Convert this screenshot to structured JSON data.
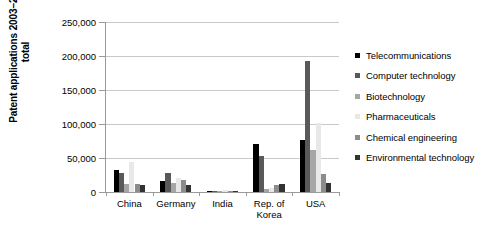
{
  "chart_data": {
    "type": "bar",
    "title": "",
    "subtitle": "",
    "xlabel": "",
    "ylabel": "Patent applications 2003–2007 total",
    "ylabel_lines": [
      "Patent applications 2003–2007",
      "total"
    ],
    "ylim": [
      0,
      250000
    ],
    "ytick_values": [
      0,
      50000,
      100000,
      150000,
      200000,
      250000
    ],
    "ytick_labels": [
      "0",
      "50,000",
      "100,000",
      "150,000",
      "200,000",
      "250,000"
    ],
    "grid": true,
    "grid_axis": "y",
    "legend_position": "right",
    "categories": [
      "China",
      "Germany",
      "India",
      "Rep. of Korea",
      "USA"
    ],
    "category_labels": [
      "China",
      "Germany",
      "India",
      "Rep. of\nKorea",
      "USA"
    ],
    "series": [
      {
        "name": "Telecommunications",
        "color": "#000000",
        "values": [
          32000,
          15500,
          1200,
          71000,
          77000
        ]
      },
      {
        "name": "Computer technology",
        "color": "#595959",
        "values": [
          28500,
          28000,
          1800,
          53000,
          192000
        ]
      },
      {
        "name": "Biotechnology",
        "color": "#a6a6a6",
        "values": [
          12500,
          13000,
          1500,
          5000,
          62000
        ]
      },
      {
        "name": "Pharmaceuticals",
        "color": "#e8e8e8",
        "values": [
          44000,
          21000,
          2600,
          6000,
          101000
        ]
      },
      {
        "name": "Chemical engineering",
        "color": "#8c8c8c",
        "values": [
          12000,
          18000,
          1600,
          11000,
          27000
        ]
      },
      {
        "name": "Environmental technology",
        "color": "#333333",
        "values": [
          11000,
          10000,
          1400,
          12000,
          13500
        ]
      }
    ]
  },
  "legend": {
    "items": [
      "Telecommunications",
      "Computer technology",
      "Biotechnology",
      "Pharmaceuticals",
      "Chemical engineering",
      "Environmental technology"
    ]
  },
  "colors": {
    "axis": "#9a9a9a",
    "grid": "#c9c9c9",
    "text": "#000000",
    "background": "#ffffff"
  }
}
